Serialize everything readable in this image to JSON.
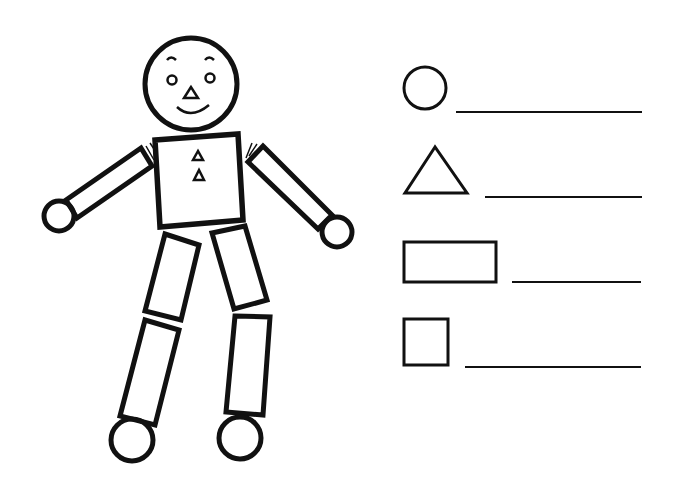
{
  "worksheet": {
    "title": "Shape robot worksheet",
    "stroke_color": "#111111",
    "background": "#ffffff",
    "robot": {
      "parts": [
        "head",
        "torso",
        "left-arm",
        "right-arm",
        "left-hand",
        "right-hand",
        "left-thigh",
        "right-thigh",
        "left-shin",
        "right-shin",
        "left-foot",
        "right-foot"
      ]
    },
    "legend": [
      {
        "shape": "circle",
        "answer": ""
      },
      {
        "shape": "triangle",
        "answer": ""
      },
      {
        "shape": "rectangle",
        "answer": ""
      },
      {
        "shape": "square",
        "answer": ""
      }
    ]
  }
}
